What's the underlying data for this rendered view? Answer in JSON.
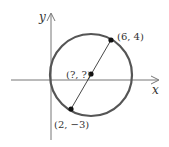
{
  "diagram": {
    "axes": {
      "x_label": "x",
      "y_label": "y"
    },
    "points": [
      {
        "id": "endpoint-top",
        "label": "(6, 4)"
      },
      {
        "id": "center",
        "label": "(?, ?)"
      },
      {
        "id": "endpoint-bottom",
        "label": "(2, −3)"
      }
    ],
    "colors": {
      "circle": "#555555",
      "axes": "#777777",
      "diameter": "#333333",
      "dots": "#111111"
    }
  }
}
